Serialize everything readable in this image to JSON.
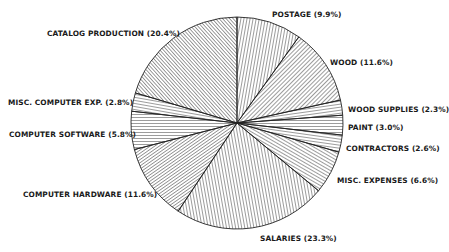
{
  "chart_data": {
    "type": "pie",
    "title": "",
    "start_angle_deg": 0,
    "direction": "clockwise",
    "legend": "none (slice labels placed around pie)",
    "slices": [
      {
        "label": "POSTAGE",
        "value": 9.9,
        "text": "POSTAGE (9.9%)",
        "hatch_angle": 80,
        "hatch_gap": 3.0
      },
      {
        "label": "WOOD",
        "value": 11.6,
        "text": "WOOD (11.6%)",
        "hatch_angle": 45,
        "hatch_gap": 3.0
      },
      {
        "label": "WOOD SUPPLIES",
        "value": 2.3,
        "text": "WOOD SUPPLIES (2.3%)",
        "hatch_angle": 8,
        "hatch_gap": 3.0
      },
      {
        "label": "PAINT",
        "value": 3.0,
        "text": "PAINT (3.0%)",
        "hatch_angle": 0,
        "hatch_gap": 3.0
      },
      {
        "label": "CONTRACTORS",
        "value": 2.6,
        "text": "CONTRACTORS (2.6%)",
        "hatch_angle": -8,
        "hatch_gap": 3.0
      },
      {
        "label": "MISC. EXPENSES",
        "value": 6.6,
        "text": "MISC. EXPENSES (6.6%)",
        "hatch_angle": -30,
        "hatch_gap": 3.0
      },
      {
        "label": "SALARIES",
        "value": 23.3,
        "text": "SALARIES (23.3%)",
        "hatch_angle": 100,
        "hatch_gap": 3.0
      },
      {
        "label": "COMPUTER HARDWARE",
        "value": 11.6,
        "text": "COMPUTER HARDWARE (11.6%)",
        "hatch_angle": 35,
        "hatch_gap": 2.6
      },
      {
        "label": "COMPUTER SOFTWARE",
        "value": 5.8,
        "text": "COMPUTER SOFTWARE (5.8%)",
        "hatch_angle": 0,
        "hatch_gap": 3.0
      },
      {
        "label": "MISC. COMPUTER EXP.",
        "value": 2.8,
        "text": "MISC. COMPUTER EXP. (2.8%)",
        "hatch_angle": -10,
        "hatch_gap": 3.0
      },
      {
        "label": "CATALOG PRODUCTION",
        "value": 20.4,
        "text": "CATALOG PRODUCTION (20.4%)",
        "hatch_angle": -48,
        "hatch_gap": 2.6
      }
    ]
  },
  "labels": {
    "postage": "POSTAGE (9.9%)",
    "wood": "WOOD (11.6%)",
    "wood_supplies": "WOOD SUPPLIES (2.3%)",
    "paint": "PAINT (3.0%)",
    "contractors": "CONTRACTORS (2.6%)",
    "misc_expenses": "MISC. EXPENSES (6.6%)",
    "salaries": "SALARIES (23.3%)",
    "computer_hardware": "COMPUTER HARDWARE (11.6%)",
    "computer_software": "COMPUTER SOFTWARE (5.8%)",
    "misc_computer": "MISC. COMPUTER EXP. (2.8%)",
    "catalog_production": "CATALOG PRODUCTION (20.4%)"
  },
  "style": {
    "line_color": "#222222",
    "background": "#ffffff"
  }
}
